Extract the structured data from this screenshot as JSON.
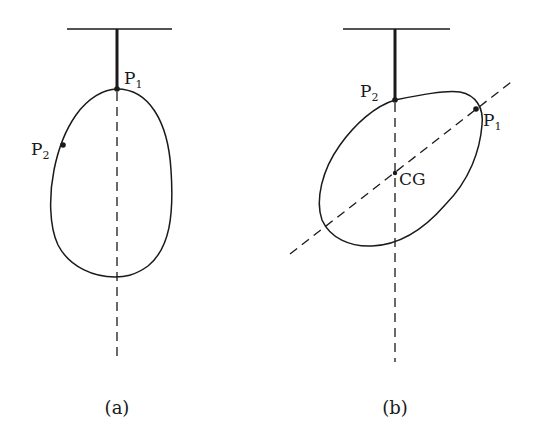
{
  "figure": {
    "panels": [
      {
        "id": "a",
        "caption": "(a)",
        "points": [
          {
            "name": "P",
            "sub": "1",
            "role": "suspension point"
          },
          {
            "name": "P",
            "sub": "2",
            "role": "second point on body"
          }
        ]
      },
      {
        "id": "b",
        "caption": "(b)",
        "points": [
          {
            "name": "P",
            "sub": "2",
            "role": "suspension point"
          },
          {
            "name": "P",
            "sub": "1",
            "role": "first point on body"
          },
          {
            "name": "CG",
            "role": "center of gravity (intersection of plumb lines)"
          }
        ]
      }
    ],
    "colors": {
      "ink": "#1a1a1a",
      "background": "#ffffff"
    }
  }
}
